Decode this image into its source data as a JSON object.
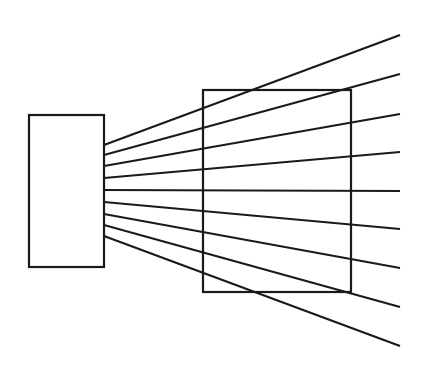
{
  "diagram": {
    "width": 422,
    "height": 379,
    "background": "#ffffff",
    "stroke_color": "#1a1a1a",
    "stroke_width": 2.2,
    "source_box": {
      "x": 29,
      "y": 115,
      "w": 75,
      "h": 152
    },
    "screen_box": {
      "x": 203,
      "y": 90,
      "w": 148,
      "h": 202
    },
    "rays": [
      {
        "x1": 104,
        "y1": 145,
        "x2": 400,
        "y2": 35
      },
      {
        "x1": 104,
        "y1": 155,
        "x2": 400,
        "y2": 74
      },
      {
        "x1": 104,
        "y1": 166,
        "x2": 400,
        "y2": 114
      },
      {
        "x1": 104,
        "y1": 178,
        "x2": 400,
        "y2": 152
      },
      {
        "x1": 104,
        "y1": 190,
        "x2": 400,
        "y2": 191
      },
      {
        "x1": 104,
        "y1": 202,
        "x2": 400,
        "y2": 229
      },
      {
        "x1": 104,
        "y1": 214,
        "x2": 400,
        "y2": 268
      },
      {
        "x1": 104,
        "y1": 225,
        "x2": 400,
        "y2": 307
      },
      {
        "x1": 104,
        "y1": 236,
        "x2": 400,
        "y2": 346
      }
    ]
  }
}
